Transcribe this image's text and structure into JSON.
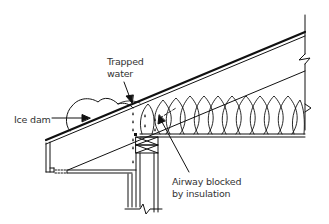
{
  "diagram": {
    "type": "roof-eave-cross-section",
    "labels": {
      "trapped_water_line1": "Trapped",
      "trapped_water_line2": "water",
      "ice_dam": "Ice dam",
      "airway_line1": "Airway blocked",
      "airway_line2": "by insulation"
    },
    "colors": {
      "stroke": "#111111",
      "text": "#333333",
      "background": "#ffffff"
    }
  }
}
